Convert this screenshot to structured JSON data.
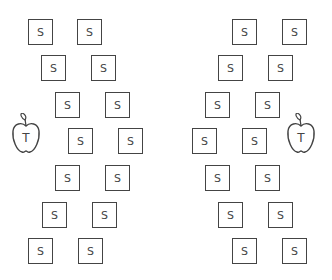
{
  "seat_label": "S",
  "teacher_label": "T",
  "left_group": {
    "teacher": {
      "x": 10,
      "y": 113
    },
    "seats": [
      {
        "x": 28,
        "y": 19
      },
      {
        "x": 77,
        "y": 19
      },
      {
        "x": 41,
        "y": 55
      },
      {
        "x": 91,
        "y": 55
      },
      {
        "x": 55,
        "y": 92
      },
      {
        "x": 105,
        "y": 92
      },
      {
        "x": 68,
        "y": 128
      },
      {
        "x": 118,
        "y": 128
      },
      {
        "x": 55,
        "y": 165
      },
      {
        "x": 105,
        "y": 165
      },
      {
        "x": 42,
        "y": 202
      },
      {
        "x": 92,
        "y": 202
      },
      {
        "x": 28,
        "y": 238
      },
      {
        "x": 78,
        "y": 238
      }
    ]
  },
  "right_group": {
    "teacher": {
      "x": 285,
      "y": 113
    },
    "seats": [
      {
        "x": 232,
        "y": 19
      },
      {
        "x": 282,
        "y": 19
      },
      {
        "x": 218,
        "y": 55
      },
      {
        "x": 268,
        "y": 55
      },
      {
        "x": 205,
        "y": 92
      },
      {
        "x": 255,
        "y": 92
      },
      {
        "x": 192,
        "y": 128
      },
      {
        "x": 242,
        "y": 128
      },
      {
        "x": 205,
        "y": 165
      },
      {
        "x": 255,
        "y": 165
      },
      {
        "x": 218,
        "y": 202
      },
      {
        "x": 268,
        "y": 202
      },
      {
        "x": 232,
        "y": 238
      },
      {
        "x": 282,
        "y": 238
      }
    ]
  }
}
